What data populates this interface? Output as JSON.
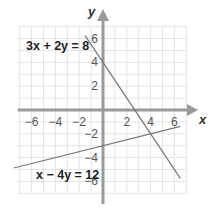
{
  "chart_data": {
    "type": "line",
    "title": "",
    "xlabel": "x",
    "ylabel": "y",
    "xlim": [
      -7.5,
      7
    ],
    "ylim": [
      -7,
      7.5
    ],
    "grid": true,
    "x_ticks": [
      -6,
      -4,
      -2,
      2,
      4,
      6
    ],
    "y_ticks": [
      -6,
      -4,
      -2,
      2,
      4,
      6
    ],
    "x_tick_labels": [
      "−6",
      "−4",
      "−2",
      "2",
      "4",
      "6"
    ],
    "y_tick_labels": [
      "−6",
      "−4",
      "−2",
      "2",
      "4",
      "6"
    ],
    "series": [
      {
        "name": "3x + 2y = 8",
        "label": "3x + 2y = 8",
        "equation": "y = 4 - 1.5x",
        "x": [
          -1.5,
          6.5
        ],
        "y": [
          6.25,
          -5.75
        ],
        "color": "#777777"
      },
      {
        "name": "x − 4y = 12",
        "label": "x − 4y = 12",
        "equation": "y = 0.25x - 3",
        "x": [
          -7.5,
          6.5
        ],
        "y": [
          -4.875,
          -1.375
        ],
        "color": "#777777"
      }
    ],
    "intersection": [
      3.714,
      -2.071
    ],
    "legend": "none (inline equation labels)"
  },
  "colors": {
    "grid": "#e4e4e4",
    "axis": "#9a9a9a",
    "line": "#777777",
    "text": "#222222"
  },
  "labels": {
    "x_axis": "x",
    "y_axis": "y",
    "eq1": "3x + 2y = 8",
    "eq2": "x − 4y = 12"
  }
}
